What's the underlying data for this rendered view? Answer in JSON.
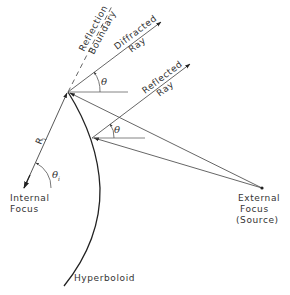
{
  "diagram": {
    "labels": {
      "reflection_boundary_line1": "Reflection",
      "reflection_boundary_line2": "Boundary",
      "diffracted_ray_line1": "Diffracted",
      "diffracted_ray_line2": "Ray",
      "reflected_ray_line1": "Reflected",
      "reflected_ray_line2": "Ray",
      "theta": "θ",
      "theta_lower": "θ",
      "theta_i": "θ",
      "theta_i_sub": "i",
      "r_i": "R",
      "r_i_sub": "i",
      "internal_focus_line1": "Internal",
      "internal_focus_line2": "Focus",
      "external_focus_line1": "External",
      "external_focus_line2": "Focus",
      "external_focus_line3": "(Source)",
      "hyperboloid": "Hyperboloid"
    },
    "colors": {
      "line": "#444444",
      "axis_highlight": "#6fd3cf",
      "text": "#333333"
    }
  }
}
